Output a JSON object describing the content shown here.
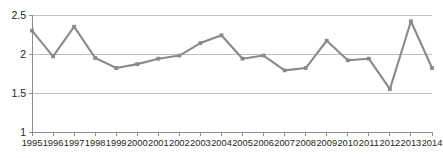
{
  "chart_data": {
    "type": "line",
    "title": "",
    "subtitle": "",
    "xlabel": "",
    "ylabel": "",
    "categories": [
      "1995",
      "1996",
      "1997",
      "1998",
      "1999",
      "2000",
      "2001",
      "2002",
      "2003",
      "2004",
      "2005",
      "2006",
      "2007",
      "2008",
      "2009",
      "2010",
      "2011",
      "2012",
      "2013",
      "2014"
    ],
    "values": [
      2.3,
      1.97,
      2.35,
      1.95,
      1.82,
      1.87,
      1.94,
      1.98,
      2.14,
      2.24,
      1.94,
      1.98,
      1.79,
      1.82,
      2.17,
      1.92,
      1.94,
      1.55,
      2.42,
      1.82
    ],
    "series": [
      {
        "name": "",
        "values": [
          2.3,
          1.97,
          2.35,
          1.95,
          1.82,
          1.87,
          1.94,
          1.98,
          2.14,
          2.24,
          1.94,
          1.98,
          1.79,
          1.82,
          2.17,
          1.92,
          1.94,
          1.55,
          2.42,
          1.82
        ]
      }
    ],
    "ylim": [
      1,
      2.5
    ],
    "yticks": [
      1,
      1.5,
      2,
      2.5
    ],
    "ytick_labels": [
      "1",
      "1.5",
      "2",
      "2.5"
    ],
    "xtick_labels": [
      "1995",
      "1996",
      "1997",
      "1998",
      "1999",
      "2000",
      "2001",
      "2002",
      "2003",
      "2004",
      "2005",
      "2006",
      "2007",
      "2008",
      "2009",
      "2010",
      "2011",
      "2012",
      "2013",
      "2014"
    ],
    "grid": true,
    "grid_axis": "y",
    "legend": false,
    "legend_position": "none",
    "markers": true,
    "annotations": []
  },
  "style": {
    "line_color": "#8a8a8a",
    "marker_color": "#8a8a8a",
    "grid_color": "#bfbfbf",
    "axis_color": "#8c8c8c",
    "text_color": "#231f20",
    "background": "#ffffff"
  }
}
